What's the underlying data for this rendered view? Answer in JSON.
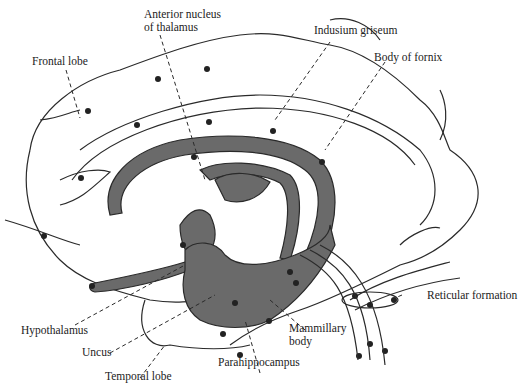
{
  "diagram": {
    "colors": {
      "fill": "#6a6a6a",
      "stroke": "#2a2a2a",
      "background": "#ffffff"
    },
    "labels": {
      "anterior_nucleus_line1": "Anterior nucleus",
      "anterior_nucleus_line2": "of thalamus",
      "indusium_griseum": "Indusium griseum",
      "frontal_lobe": "Frontal lobe",
      "body_of_fornix": "Body of fornix",
      "reticular_formation": "Reticular formation",
      "hypothalamus": "Hypothalamus",
      "mammillary_line1": "Mammillary",
      "mammillary_line2": "body",
      "uncus": "Uncus",
      "parahippocampus": "Parahippocampus",
      "temporal_lobe": "Temporal lobe"
    }
  }
}
